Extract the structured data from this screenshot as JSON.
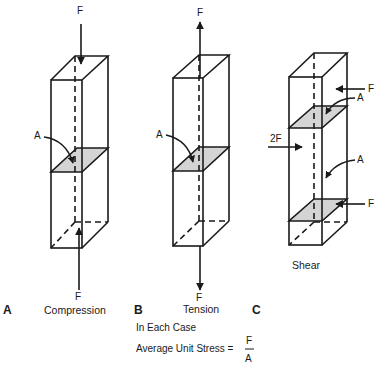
{
  "panels": [
    {
      "letter": "A",
      "caption": "Compression",
      "force_top": "F",
      "force_bottom": "F",
      "area_label": "A"
    },
    {
      "letter": "B",
      "caption": "Tension",
      "force_top": "F",
      "force_bottom": "F",
      "area_label": "A"
    },
    {
      "letter": "C",
      "caption": "Shear",
      "force_right_top": "F",
      "force_left_middle": "2F",
      "force_right_bottom": "F",
      "area_label_top": "A",
      "area_label_bottom": "A"
    }
  ],
  "formula": {
    "intro": "In Each Case",
    "lhs": "Average Unit Stress =",
    "numerator": "F",
    "denominator": "A"
  },
  "colors": {
    "line": "#1a1a1a",
    "shaded_section": "#d4d4d4"
  }
}
